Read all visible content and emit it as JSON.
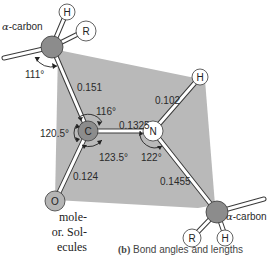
{
  "diagram": {
    "atoms": {
      "alpha_carbon_top": {
        "symbol": "",
        "label": "α-carbon"
      },
      "h_top": {
        "symbol": "H"
      },
      "r_top": {
        "symbol": "R"
      },
      "carbonyl_c": {
        "symbol": "C"
      },
      "oxygen": {
        "symbol": "O"
      },
      "nitrogen": {
        "symbol": "N"
      },
      "h_amide": {
        "symbol": "H"
      },
      "alpha_carbon_bottom": {
        "symbol": "",
        "label": "α-carbon"
      },
      "r_bottom": {
        "symbol": "R"
      },
      "h_bottom": {
        "symbol": "H"
      }
    },
    "alpha_prefix": "α",
    "alpha_suffix": "-carbon",
    "bond_lengths": {
      "calpha_c": "0.151",
      "c_n": "0.1325",
      "n_h": "0.102",
      "c_o": "0.124",
      "n_calpha": "0.1455"
    },
    "bond_angles": {
      "calpha_top": "111°",
      "c_top": "116°",
      "c_left": "120.5°",
      "c_bottom": "123.5°",
      "n_angle": "122°"
    },
    "colors": {
      "plane": "#b9b9b9",
      "carbon": "#8c8c8c",
      "oxygen": "#b5b5b5",
      "nitrogen": "#ffffff",
      "hydrogen": "#ffffff",
      "bond": "#ffffff",
      "outline": "#3a3a3a"
    }
  },
  "body_text": {
    "line1": "mole-",
    "line2": "or. Sol-",
    "line3": "ecules"
  },
  "caption": {
    "prefix": "(b)",
    "text": " Bond angles and lengths"
  }
}
